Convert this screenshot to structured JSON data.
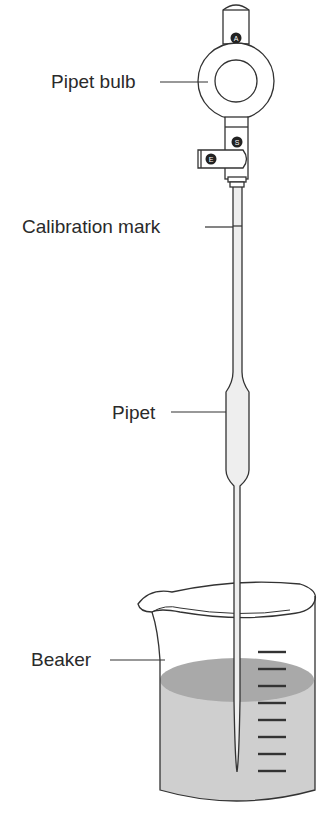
{
  "diagram": {
    "type": "lab-apparatus",
    "labels": {
      "pipet_bulb": "Pipet bulb",
      "calibration_mark": "Calibration mark",
      "pipet": "Pipet",
      "beaker": "Beaker"
    },
    "valves": {
      "top": "A",
      "middle": "S",
      "side": "E"
    },
    "beaker_graduation_count": 8,
    "colors": {
      "line": "#333333",
      "liquid": "#cfcfcf",
      "liquid_surface": "#a9a9a9",
      "glass": "#eeeeee",
      "valve_dot": "#222222"
    }
  }
}
